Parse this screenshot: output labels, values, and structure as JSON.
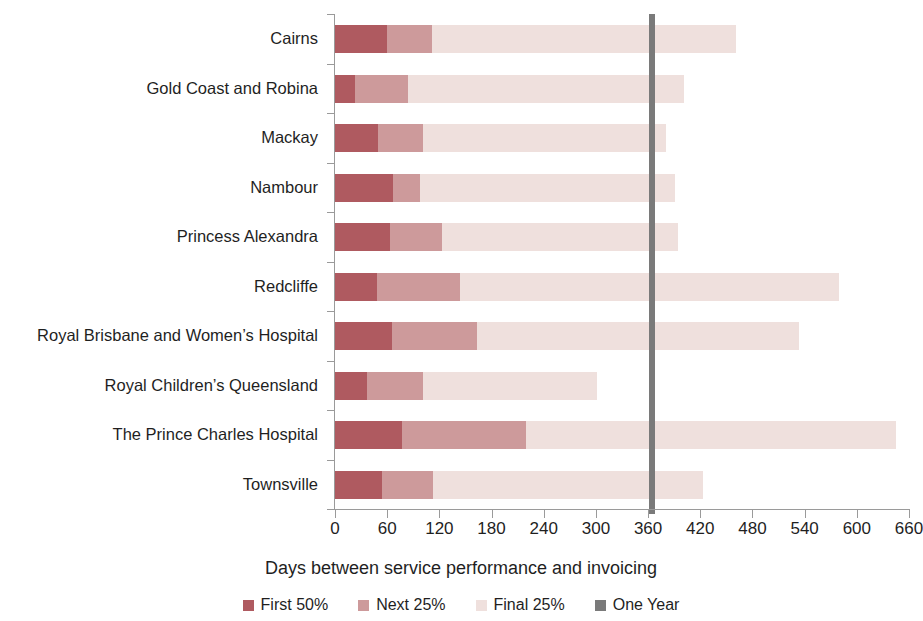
{
  "chart_data": {
    "type": "bar",
    "orientation": "horizontal",
    "stacked": true,
    "title": "",
    "xlabel": "Days between service performance and invoicing",
    "ylabel": "",
    "xlim": [
      0,
      660
    ],
    "xticks": [
      0,
      60,
      120,
      180,
      240,
      300,
      360,
      420,
      480,
      540,
      600,
      660
    ],
    "xtick_labels": [
      "0",
      "60",
      "120",
      "180",
      "240",
      "300",
      "360",
      "420",
      "480",
      "540",
      "600",
      "660"
    ],
    "grid": false,
    "legend_position": "bottom",
    "categories": [
      "Cairns",
      "Gold Coast and Robina",
      "Mackay",
      "Nambour",
      "Princess Alexandra",
      "Redcliffe",
      "Royal Brisbane and Women’s Hospital",
      "Royal Children’s Queensland",
      "The Prince Charles Hospital",
      "Townsville"
    ],
    "series": [
      {
        "name": "First 50%",
        "color": "#af5a60",
        "values": [
          60,
          23,
          49,
          67,
          63,
          48,
          65,
          37,
          77,
          54
        ]
      },
      {
        "name": "Next 25%",
        "color": "#cd9a9b",
        "values": [
          52,
          61,
          52,
          31,
          60,
          96,
          98,
          64,
          143,
          59
        ]
      },
      {
        "name": "Final 25%",
        "color": "#efe0dd",
        "values": [
          349,
          317,
          280,
          293,
          271,
          435,
          371,
          200,
          425,
          310
        ]
      }
    ],
    "cumulative_totals": [
      461,
      401,
      381,
      391,
      394,
      579,
      534,
      301,
      645,
      423
    ],
    "annotations": [
      {
        "name": "One Year",
        "type": "vertical-line",
        "value": 365,
        "color": "#7a7a7a"
      }
    ],
    "legend": [
      {
        "label": "First 50%",
        "color": "#af5a60",
        "swatch": "square"
      },
      {
        "label": "Next 25%",
        "color": "#cd9a9b",
        "swatch": "square"
      },
      {
        "label": "Final 25%",
        "color": "#efe0dd",
        "swatch": "square"
      },
      {
        "label": "One Year",
        "color": "#7a7a7a",
        "swatch": "square"
      }
    ]
  }
}
